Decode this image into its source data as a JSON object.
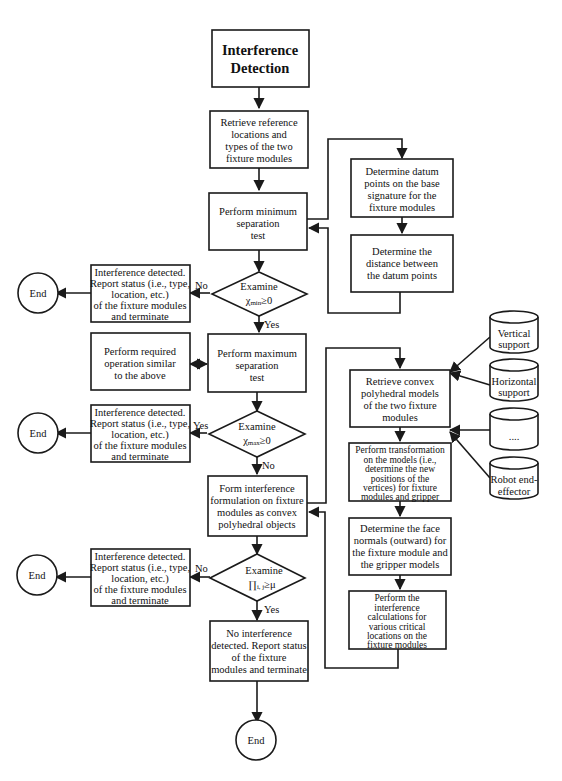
{
  "title": {
    "line1": "Interference",
    "line2": "Detection"
  },
  "main_flow": {
    "retrieve_reference": [
      "Retrieve reference",
      "locations and",
      "types of the two",
      "fixture modules"
    ],
    "min_sep_test": [
      "Perform  minimum",
      "separation",
      "test"
    ],
    "examine_min": {
      "line1": "Examine",
      "symbol": "χ",
      "sub": "min",
      "rel": "≥0"
    },
    "max_sep_test": [
      "Perform  maximum",
      "separation",
      "test"
    ],
    "examine_max": {
      "line1": "Examine",
      "symbol": "χ",
      "sub": "max",
      "rel": "≥0"
    },
    "form_formulation": [
      "Form  interference",
      "formulation on fixture",
      "modules as convex",
      "polyhedral objects"
    ],
    "examine_pi": {
      "line1": "Examine",
      "symbol": "∏",
      "sub": "i, j",
      "rel": "≥μ"
    },
    "no_interference": [
      "No  interference",
      "detected. Report status",
      "of the fixture",
      "modules and terminate"
    ]
  },
  "left_flow": {
    "interference_detected": [
      "Interference  detected.",
      "Report status (i.e., type,",
      "location,  etc.)",
      "of the fixture modules",
      "and  terminate"
    ],
    "required_operation": [
      "Perform  required",
      "operation  similar",
      "to the above"
    ],
    "end_label": "End"
  },
  "datum_flow": {
    "datum_points": [
      "Determine  datum",
      "points on the base",
      "signature for the",
      "fixture modules"
    ],
    "datum_distance": [
      "Determine  the",
      "distance  between",
      "the datum points"
    ]
  },
  "polyhedral_flow": {
    "retrieve_convex": [
      "Retrieve  convex",
      "polyhedral  models",
      "of the two fixture",
      "modules"
    ],
    "transformation": [
      "Perform  transformation",
      "on the models (i.e.,",
      "determine the new",
      "positions of the",
      "vertices) for fixture",
      "modules and gripper"
    ],
    "face_normals": [
      "Determine the face",
      "normals (outward) for",
      "the fixture module and",
      "the gripper models"
    ],
    "interference_calc": [
      "Perform  the",
      "interference",
      "calculations  for",
      "various  critical",
      "locations on the",
      "fixture modules"
    ]
  },
  "databases": [
    {
      "lines": [
        "Vertical",
        "support"
      ]
    },
    {
      "lines": [
        "Horizontal",
        "support"
      ]
    },
    {
      "lines": [
        "...."
      ]
    },
    {
      "lines": [
        "Robot  end-",
        "effector"
      ]
    }
  ],
  "labels": {
    "yes": "Yes",
    "no": "No"
  }
}
